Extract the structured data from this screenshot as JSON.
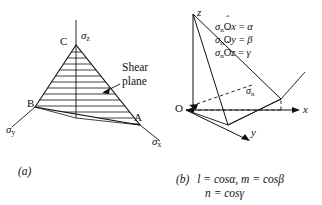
{
  "figure": {
    "panels": [
      {
        "id": "a",
        "caption": "(a)",
        "title_vertices": {
          "c": "C",
          "b": "B",
          "a": "A"
        },
        "axis_labels": {
          "sigma_z": "σ",
          "sigma_z_sub": "z",
          "sigma_y": "σ",
          "sigma_y_sub": "y",
          "sigma_x": "σ",
          "sigma_x_sub": "x"
        },
        "annotation": {
          "line1": "Shear",
          "line2": "plane"
        }
      },
      {
        "id": "b",
        "caption_prefix": "(b)",
        "caption_line1": "l = cosα, m = cosβ",
        "caption_line2": "n = cosγ",
        "axis_labels": {
          "z": "z",
          "x": "x",
          "y": "y",
          "origin": "O"
        },
        "normal_label": {
          "symbol": "σ",
          "sub": "n"
        },
        "equations": [
          {
            "lhs_sym": "σ",
            "lhs_sub": "n",
            "vertex": "O",
            "axis": "x",
            "rhs": "α"
          },
          {
            "lhs_sym": "σ",
            "lhs_sub": "n",
            "vertex": "O",
            "axis": "y",
            "rhs": "β"
          },
          {
            "lhs_sym": "σ",
            "lhs_sub": "n",
            "vertex": "O",
            "axis": "z",
            "rhs": "γ"
          }
        ]
      }
    ],
    "colors": {
      "ink": "#111111",
      "background": "#ffffff"
    }
  }
}
